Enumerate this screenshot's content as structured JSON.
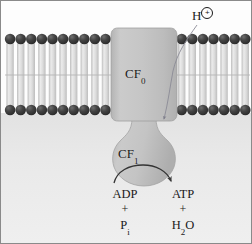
{
  "figure": {
    "width": 252,
    "height": 244
  },
  "labels": {
    "cf0": "CF",
    "cf0_sub": "0",
    "cf1": "CF",
    "cf1_sub": "1",
    "proton": "H",
    "proton_charge": "+"
  },
  "reaction": {
    "left": {
      "substrate": "ADP",
      "plus": "+",
      "cosubstrate": "P",
      "cosubstrate_sub": "i"
    },
    "right": {
      "product": "ATP",
      "plus": "+",
      "coproduct_a": "H",
      "coproduct_sub": "2",
      "coproduct_b": "O"
    }
  },
  "colors": {
    "background_top": "#fdfdfd",
    "background_bottom": "#e7e7e7",
    "lipid_head": "#3a3a3a",
    "lipid_tail": "#d9d9d9",
    "protein_fill": "#c2c2c2",
    "protein_edge": "#9a9a9a",
    "arrow": "#3a3a3a",
    "text": "#1a1a1a",
    "border": "#8a8a8a"
  },
  "membrane": {
    "head_radius": 5.2,
    "top_head_row_y": 38,
    "bottom_head_row_y": 109,
    "left_span": [
      5,
      110
    ],
    "right_span": [
      176,
      248
    ],
    "head_spacing": 10.6
  },
  "protein": {
    "cf0": {
      "x": 110,
      "y": 27,
      "width": 66,
      "height": 94,
      "shape": "rounded-rectangle"
    },
    "stalk": {
      "x": 129,
      "y": 118,
      "width": 28,
      "height": 22
    },
    "cf1": {
      "cx": 143,
      "cy": 157,
      "rx": 31,
      "ry": 29,
      "shape": "bulb"
    }
  }
}
